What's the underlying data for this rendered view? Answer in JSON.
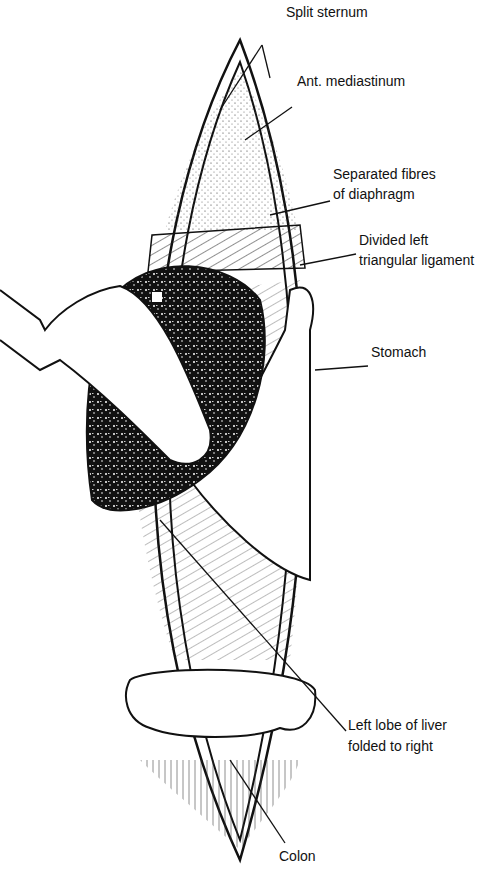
{
  "figure": {
    "labels": [
      {
        "id": "split-sternum",
        "text": "Split sternum",
        "x": 286,
        "y": 18
      },
      {
        "id": "ant-mediastinum",
        "text": "Ant. mediastinum",
        "x": 297,
        "y": 87
      },
      {
        "id": "separated-fibres-1",
        "text": "Separated fibres",
        "x": 333,
        "y": 180
      },
      {
        "id": "separated-fibres-2",
        "text": "of diaphragm",
        "x": 333,
        "y": 200
      },
      {
        "id": "divided-left-1",
        "text": "Divided left",
        "x": 359,
        "y": 246
      },
      {
        "id": "divided-left-2",
        "text": "triangular ligament",
        "x": 359,
        "y": 266
      },
      {
        "id": "stomach",
        "text": "Stomach",
        "x": 371,
        "y": 358
      },
      {
        "id": "left-lobe-1",
        "text": "Left lobe of liver",
        "x": 348,
        "y": 731
      },
      {
        "id": "left-lobe-2",
        "text": "folded to right",
        "x": 348,
        "y": 752
      },
      {
        "id": "colon",
        "text": "Colon",
        "x": 279,
        "y": 847
      }
    ]
  }
}
